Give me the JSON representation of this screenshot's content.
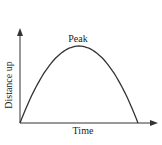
{
  "diagram": {
    "type": "line",
    "labels": {
      "peak": "Peak",
      "xlabel": "Time",
      "ylabel": "Distance up"
    },
    "colors": {
      "curve": "#333333",
      "axis": "#333333",
      "text": "#222222"
    }
  },
  "chart_data": {
    "type": "line",
    "title": "",
    "xlabel": "Time",
    "ylabel": "Distance up",
    "annotations": [
      "Peak"
    ],
    "xlim": [
      0,
      1.15
    ],
    "ylim": [
      0,
      1.2
    ],
    "grid": false,
    "series": [
      {
        "name": "Distance up",
        "x": [
          0,
          0.1,
          0.2,
          0.3,
          0.4,
          0.5,
          0.6,
          0.7,
          0.8,
          0.9,
          1.0
        ],
        "values": [
          0,
          0.36,
          0.64,
          0.84,
          0.96,
          1.0,
          0.96,
          0.84,
          0.64,
          0.36,
          0
        ]
      }
    ],
    "ticks": "none"
  }
}
